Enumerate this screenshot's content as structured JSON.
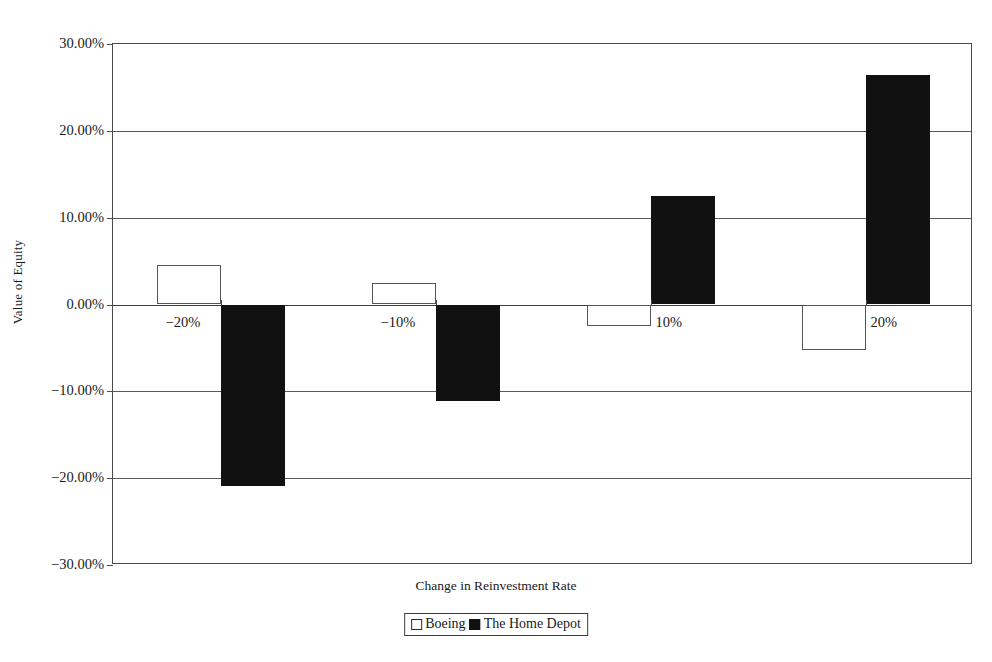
{
  "chart_data": {
    "type": "bar",
    "title": "",
    "xlabel": "Change in Reinvestment Rate",
    "ylabel": "Value of Equity",
    "categories": [
      "-20%",
      "-10%",
      "10%",
      "20%"
    ],
    "series": [
      {
        "name": "Boeing",
        "color": "#ffffff",
        "values": [
          4.5,
          2.5,
          -2.5,
          -5.2
        ]
      },
      {
        "name": "The Home Depot",
        "color": "#111111",
        "values": [
          -20.9,
          -11.1,
          12.5,
          26.4
        ]
      }
    ],
    "ylim": [
      -30,
      30
    ],
    "ytick_values": [
      30,
      20,
      10,
      0,
      -10,
      -20,
      -30
    ],
    "ytick_labels": [
      "30.00%",
      "20.00%",
      "10.00%",
      "0.00%",
      "-10.00%",
      "-20.00%",
      "-30.00%"
    ],
    "grid": true,
    "legend_position": "bottom",
    "legend_entries": [
      "Boeing",
      "The Home Depot"
    ]
  },
  "axes": {
    "y_title": "Value of Equity",
    "x_title": "Change in Reinvestment Rate"
  },
  "legend": {
    "boeing_label": "Boeing",
    "home_depot_label": "The Home Depot"
  }
}
